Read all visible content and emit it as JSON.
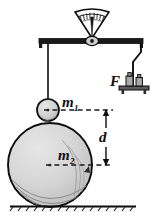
{
  "figure": {
    "background_color": "#ffffff",
    "ink_color": "#0d0d0d",
    "sphere_fill": "#d2d2d2",
    "sphere_fill_light": "#e2e2e2",
    "pan_fill": "#8a8a8a"
  },
  "labels": {
    "m1": {
      "base": "m",
      "sub": "1",
      "meaning": "small-hanging-mass"
    },
    "m2": {
      "base": "m",
      "sub": "2",
      "meaning": "large-sphere-mass"
    },
    "d": {
      "base": "d",
      "sub": "",
      "meaning": "center-to-center-separation-distance"
    },
    "F": {
      "base": "F",
      "sub": "",
      "meaning": "force-counterweight-pan"
    }
  },
  "parts": {
    "gauge": "dial-scale-gauge",
    "beam": "balance-beam",
    "pivot": "beam-pivot",
    "suspension_wire": "left-suspension-wire",
    "counterweight_wire": "right-counterweight-wire",
    "small_sphere": "small-sphere-m1",
    "large_sphere": "large-sphere-m2",
    "weight_pan": "weight-pan",
    "weights": [
      "weight-block-1",
      "weight-block-2"
    ],
    "ground": "ground-surface",
    "dimension_arrow": "distance-dimension-arrow",
    "dashed_m1_axis": "m1-center-dashed-line",
    "dashed_m2_axis": "m2-center-dashed-line"
  },
  "geometry": {
    "beam_y": 41,
    "beam_left_x": 39,
    "beam_right_x": 143,
    "pivot_x": 92,
    "m1_center": {
      "x": 48,
      "y": 110
    },
    "m1_radius": 11,
    "m2_center": {
      "x": 50,
      "y": 165
    },
    "m2_radius": 42,
    "dimension_top_y": 110,
    "dimension_bottom_y": 165,
    "dimension_x": 106,
    "ground_y": 207
  }
}
